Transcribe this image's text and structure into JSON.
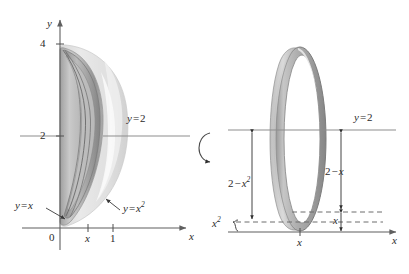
{
  "figure": {
    "type": "calculus-solid-of-revolution",
    "panels": [
      {
        "id": "left-panel",
        "name": "solid-of-revolution-3d-view",
        "axes": {
          "y_axis_label": "y",
          "x_axis_label": "x",
          "origin_label": "0",
          "y_ticks": [
            {
              "label": "4",
              "value": 4
            },
            {
              "label": "2",
              "value": 2
            }
          ],
          "x_ticks": [
            {
              "label": "x",
              "value": "x"
            },
            {
              "label": "1",
              "value": 1
            }
          ]
        },
        "annotations": [
          {
            "id": "line-y-equals-2",
            "text_parts": {
              "var": "y",
              "op": "=",
              "val": "2"
            },
            "text": "y = 2"
          },
          {
            "id": "curve-y-equals-x",
            "text_parts": {
              "var": "y",
              "op": "=",
              "val": "x"
            },
            "text": "y = x"
          },
          {
            "id": "curve-y-equals-x-squared",
            "text_parts": {
              "var": "y",
              "op": "=",
              "val": "x",
              "exp": "2"
            },
            "text": "y = x²"
          }
        ]
      },
      {
        "id": "rotation-indicator",
        "name": "rotation-arrow",
        "description": "curved arrow showing revolution about horizontal axis"
      },
      {
        "id": "right-panel",
        "name": "washer-cross-section-view",
        "axes": {
          "x_axis_label": "x",
          "x_ticks": [
            {
              "label": "x",
              "value": "x"
            }
          ]
        },
        "annotations": [
          {
            "id": "line-y-equals-2",
            "text_parts": {
              "var": "y",
              "op": "=",
              "val": "2"
            },
            "text": "y = 2"
          },
          {
            "id": "outer-radius",
            "text_parts": {
              "a": "2",
              "op": "−",
              "b": "x",
              "exp": "2"
            },
            "text": "2 − x²"
          },
          {
            "id": "inner-radius",
            "text_parts": {
              "a": "2",
              "op": "−",
              "b": "x"
            },
            "text": "2 − x"
          },
          {
            "id": "brace-x-squared",
            "text_parts": {
              "b": "x",
              "exp": "2",
              "brace": "{"
            },
            "text": "x²{"
          },
          {
            "id": "segment-x",
            "text_parts": {
              "b": "x"
            },
            "text": "x"
          }
        ]
      }
    ],
    "colors": {
      "axis": "#6e6e6e",
      "guide_line": "#8a8a8a",
      "dashed_line": "#6d6d6d",
      "surface_light": "#dedede",
      "surface_mid": "#bdbdbd",
      "surface_dark": "#9a9a9a",
      "outline": "#7d7d7d",
      "text": "#2b2b2b"
    }
  }
}
